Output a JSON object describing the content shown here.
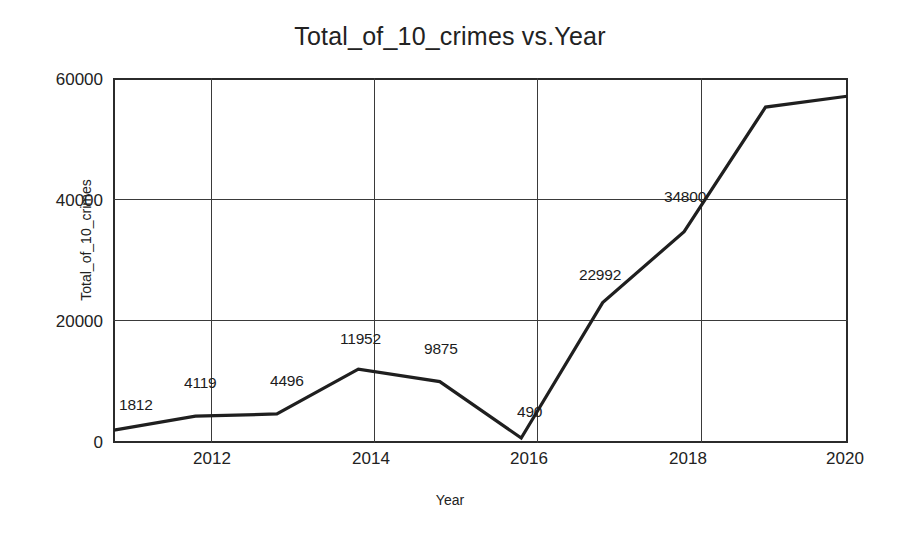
{
  "chart_data": {
    "type": "line",
    "title": "Total_of_10_crimes vs.Year",
    "xlabel": "Year",
    "ylabel": "Total_of_10_crimes",
    "x": [
      2011,
      2012,
      2013,
      2014,
      2015,
      2016,
      2017,
      2018,
      2019,
      2020
    ],
    "values": [
      1812,
      4119,
      4496,
      11952,
      9875,
      490,
      22992,
      34800,
      55500,
      57300
    ],
    "point_labels": [
      "1812",
      "4119",
      "4496",
      "11952",
      "9875",
      "490",
      "22992",
      "34800",
      "",
      ""
    ],
    "xlim": [
      2011,
      2020
    ],
    "ylim": [
      0,
      60000
    ],
    "xticks": [
      "2012",
      "2014",
      "2016",
      "2018",
      "2020"
    ],
    "xtick_values": [
      2012,
      2014,
      2016,
      2018,
      2020
    ],
    "yticks": [
      "0",
      "20000",
      "40000",
      "60000"
    ],
    "ytick_values": [
      0,
      20000,
      40000,
      60000
    ],
    "grid": true,
    "legend": false,
    "legend_position": "none",
    "line_color": "#1f1f1f",
    "background_color": "#ffffff"
  },
  "annotations": [
    {
      "text": "1812",
      "year": 2011
    },
    {
      "text": "4119",
      "year": 2012
    },
    {
      "text": "4496",
      "year": 2013
    },
    {
      "text": "11952",
      "year": 2014
    },
    {
      "text": "9875",
      "year": 2015
    },
    {
      "text": "490",
      "year": 2016
    },
    {
      "text": "22992",
      "year": 2017
    },
    {
      "text": "34800",
      "year": 2018
    }
  ]
}
